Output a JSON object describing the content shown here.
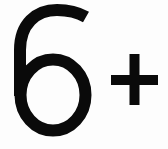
{
  "age_rating": {
    "label": "6+",
    "digit": "6",
    "suffix": "+",
    "color": "#0a0a0a",
    "background": "#fdfdfd"
  }
}
